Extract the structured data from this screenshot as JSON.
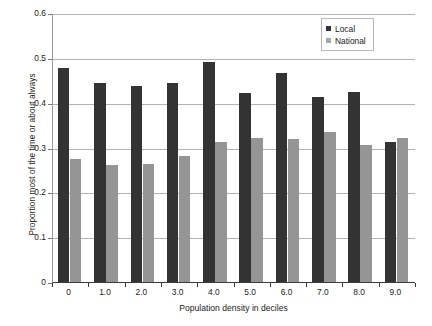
{
  "chart_data": {
    "type": "bar",
    "title": "",
    "xlabel": "Population density in deciles",
    "ylabel": "Proportion most of the time or about always",
    "categories": [
      "0",
      "1.0",
      "2.0",
      "3.0",
      "4.0",
      "5.0",
      "6.0",
      "7.0",
      "8.0",
      "9.0"
    ],
    "series": [
      {
        "name": "Local",
        "color": "#333333",
        "values": [
          0.478,
          0.443,
          0.438,
          0.445,
          0.491,
          0.421,
          0.466,
          0.413,
          0.424,
          0.313
        ]
      },
      {
        "name": "National",
        "color": "#959595",
        "values": [
          0.275,
          0.261,
          0.264,
          0.281,
          0.313,
          0.321,
          0.319,
          0.334,
          0.306,
          0.322
        ]
      }
    ],
    "ylim": [
      0,
      0.6
    ],
    "yticks": [
      "0",
      "0.1",
      "0.2",
      "0.3",
      "0.4",
      "0.5",
      "0.6"
    ],
    "ytick_values": [
      0,
      0.1,
      0.2,
      0.3,
      0.4,
      0.5,
      0.6
    ],
    "grid": "horizontal",
    "legend_position": "top-right"
  }
}
